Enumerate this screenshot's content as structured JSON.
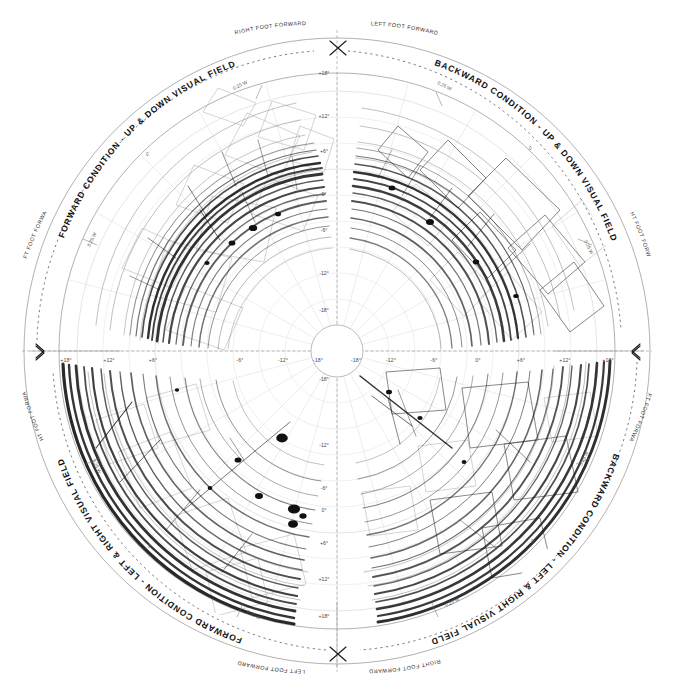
{
  "figure": {
    "background_color": "#ffffff",
    "ink_color": "#121212",
    "grid_color": "#c4c4c4",
    "center": {
      "x": 337,
      "y": 351
    },
    "outer_radius": 313,
    "dashed_ring_radius": 300,
    "plot_radius": 278,
    "center_hole_radius": 26
  },
  "quadrant_titles": [
    {
      "id": "top-left",
      "text": "FORWARD CONDITION - UP & DOWN VISUAL FIELD"
    },
    {
      "id": "top-right",
      "text": "BACKWARD CONDITION - UP & DOWN VISUAL FIELD"
    },
    {
      "id": "bottom-left",
      "text": "FORWARD CONDITION - LEFT & RIGHT VISUAL FIELD"
    },
    {
      "id": "bottom-right",
      "text": "BACKWARD CONDITION - LEFT & RIGHT VISUAL FIELD"
    }
  ],
  "foot_labels": [
    {
      "id": "top-left",
      "text": "RIGHT FOOT FORWARD"
    },
    {
      "id": "top-right",
      "text": "LEFT FOOT FORWARD"
    },
    {
      "id": "left-upper",
      "text": "LEFT FOOT FORWARD"
    },
    {
      "id": "left-lower",
      "text": "RIGHT FOOT FORWARD"
    },
    {
      "id": "right-upper",
      "text": "RIGHT FOOT FORWARD"
    },
    {
      "id": "right-lower",
      "text": "LEFT FOOT FORWARD"
    },
    {
      "id": "bottom-left",
      "text": "LEFT FOOT FORWARD"
    },
    {
      "id": "bottom-right",
      "text": "RIGHT FOOT FORWARD"
    }
  ],
  "scale_labels": [
    {
      "id": "tl",
      "text": "0.25 W"
    },
    {
      "id": "tr",
      "text": "0.25 W"
    },
    {
      "id": "lt",
      "text": "0.25 W"
    },
    {
      "id": "rt",
      "text": "0.25 W"
    },
    {
      "id": "lb",
      "text": "0.25 W"
    },
    {
      "id": "rb",
      "text": "0.25 W"
    },
    {
      "id": "bl",
      "text": "0.25 W"
    },
    {
      "id": "br",
      "text": "0.25 W"
    }
  ],
  "radial_zero_labels": [
    {
      "id": "upper-left",
      "text": "0"
    },
    {
      "id": "upper-right",
      "text": "0"
    },
    {
      "id": "lower-left",
      "text": "0"
    },
    {
      "id": "lower-right",
      "text": "0"
    }
  ],
  "chart_data": {
    "type": "line",
    "xlabel": "",
    "ylabel": "",
    "projection": "polar",
    "grid": true,
    "legend_position": "none",
    "axis_unit": "degrees",
    "radial_unit": "0.25 W",
    "quadrants": [
      "FORWARD CONDITION - UP & DOWN VISUAL FIELD",
      "BACKWARD CONDITION - UP & DOWN VISUAL FIELD",
      "FORWARD CONDITION - LEFT & RIGHT VISUAL FIELD",
      "BACKWARD CONDITION - LEFT & RIGHT VISUAL FIELD"
    ],
    "axis_ticks_horizontal_left": [
      "+18°",
      "+12°",
      "+6°",
      "-6°",
      "-12°",
      "-18°"
    ],
    "axis_ticks_horizontal_right": [
      "-18°",
      "-12°",
      "-6°",
      "0°",
      "+6°",
      "+12°",
      "+18°"
    ],
    "axis_ticks_vertical_top": [
      "+18°",
      "+12°",
      "+6°",
      "0°",
      "-6°",
      "-12°",
      "-18°"
    ],
    "axis_ticks_vertical_bottom": [
      "-18°",
      "-12°",
      "-6°",
      "0°",
      "+6°",
      "+12°",
      "+18°"
    ],
    "xlim": [
      -18,
      18
    ],
    "ylim": [
      -18,
      18
    ],
    "tick_step": 6,
    "series": [
      {
        "name": "forward-up-down-traces",
        "quadrant": "top-left",
        "density": "high",
        "values": []
      },
      {
        "name": "backward-up-down-traces",
        "quadrant": "top-right",
        "density": "high",
        "values": []
      },
      {
        "name": "forward-left-right-traces",
        "quadrant": "bottom-left",
        "density": "very-high",
        "values": []
      },
      {
        "name": "backward-left-right-traces",
        "quadrant": "bottom-right",
        "density": "very-high",
        "values": []
      }
    ]
  },
  "tick_labels": {
    "h_left": [
      {
        "text": "+18°",
        "x": 66
      },
      {
        "text": "+12°",
        "x": 109
      },
      {
        "text": "+6°",
        "x": 153
      },
      {
        "text": "-6°",
        "x": 240
      },
      {
        "text": "-12°",
        "x": 283
      },
      {
        "text": "-18°",
        "x": 318
      }
    ],
    "h_right": [
      {
        "text": "-18°",
        "x": 356
      },
      {
        "text": "-12°",
        "x": 391
      },
      {
        "text": "-6°",
        "x": 434
      },
      {
        "text": "0°",
        "x": 478
      },
      {
        "text": "+6°",
        "x": 521
      },
      {
        "text": "+12°",
        "x": 565
      },
      {
        "text": "+18°",
        "x": 608
      }
    ],
    "v_top": [
      {
        "text": "+18°",
        "y": 75
      },
      {
        "text": "+12°",
        "y": 118
      },
      {
        "text": "+6°",
        "y": 153
      },
      {
        "text": "0°",
        "y": 196
      },
      {
        "text": "-6°",
        "y": 232
      },
      {
        "text": "-12°",
        "y": 275
      },
      {
        "text": "-18°",
        "y": 312
      }
    ],
    "v_bottom": [
      {
        "text": "-18°",
        "y": 381
      },
      {
        "text": "-12°",
        "y": 447
      },
      {
        "text": "-6°",
        "y": 490
      },
      {
        "text": "0°",
        "y": 512
      },
      {
        "text": "+6°",
        "y": 545
      },
      {
        "text": "+12°",
        "y": 581
      },
      {
        "text": "+18°",
        "y": 618
      }
    ]
  }
}
